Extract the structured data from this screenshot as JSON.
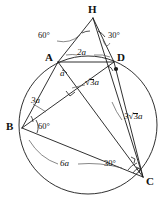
{
  "figure": {
    "type": "euclidean-geometry-diagram",
    "stroke_color": "#1a1a1a",
    "background": "#ffffff",
    "circle": {
      "cx": 88,
      "cy": 125,
      "r": 69
    },
    "points": [
      {
        "id": "H",
        "label": "H",
        "x": 93,
        "y": 18,
        "on_circle": false,
        "marker": "none"
      },
      {
        "id": "A",
        "label": "A",
        "x": 58,
        "y": 62,
        "on_circle": true,
        "marker": "none"
      },
      {
        "id": "D",
        "label": "D",
        "x": 114,
        "y": 62,
        "on_circle": true,
        "marker": "dot"
      },
      {
        "id": "B",
        "label": "B",
        "x": 22,
        "y": 128,
        "on_circle": true,
        "marker": "none"
      },
      {
        "id": "C",
        "label": "C",
        "x": 143,
        "y": 177,
        "on_circle": true,
        "marker": "none"
      },
      {
        "id": "P",
        "label": "",
        "x": 72,
        "y": 88,
        "on_circle": false,
        "marker": "none"
      }
    ],
    "segments": [
      {
        "from": "H",
        "to": "A"
      },
      {
        "from": "H",
        "to": "D"
      },
      {
        "from": "H",
        "to": "C"
      },
      {
        "from": "A",
        "to": "D"
      },
      {
        "from": "A",
        "to": "B"
      },
      {
        "from": "A",
        "to": "C"
      },
      {
        "from": "B",
        "to": "D"
      },
      {
        "from": "B",
        "to": "C"
      },
      {
        "from": "D",
        "to": "C"
      }
    ],
    "right_angle_marks": [
      {
        "at": "P",
        "x": 72,
        "y": 88
      },
      {
        "at": "C1",
        "x": 133,
        "y": 160
      },
      {
        "at": "C2",
        "x": 139,
        "y": 170
      }
    ],
    "angle_labels": [
      {
        "id": "angle-H-left",
        "text": "60°",
        "x": 38,
        "y": 35
      },
      {
        "id": "angle-H-right",
        "text": "30°",
        "x": 108,
        "y": 35
      },
      {
        "id": "angle-B",
        "text": "60°",
        "x": 33,
        "y": 122
      },
      {
        "id": "angle-C",
        "text": "30°",
        "x": 104,
        "y": 159
      }
    ],
    "segment_labels": [
      {
        "id": "len-AD",
        "text": "2a",
        "x": 79,
        "y": 51,
        "kind": "plain"
      },
      {
        "id": "len-AP",
        "text": "a",
        "x": 61,
        "y": 71,
        "kind": "plain"
      },
      {
        "id": "len-PD",
        "text": "√3 a",
        "x": 86,
        "y": 82,
        "kind": "radical",
        "coefficient": "",
        "radicand": "3",
        "suffix": "a"
      },
      {
        "id": "len-AB",
        "text": "3a",
        "x": 34,
        "y": 98,
        "kind": "plain"
      },
      {
        "id": "len-DC",
        "text": "3√3 a",
        "x": 126,
        "y": 116,
        "kind": "radical",
        "coefficient": "3",
        "radicand": "3",
        "suffix": "a"
      },
      {
        "id": "len-BC",
        "text": "6a",
        "x": 61,
        "y": 161,
        "kind": "plain"
      }
    ],
    "leader_arcs": [
      {
        "id": "leader-60-H",
        "from_label": "angle-H-left"
      },
      {
        "id": "leader-30-H",
        "from_label": "angle-H-right"
      },
      {
        "id": "leader-2a",
        "from_label": "len-AD"
      },
      {
        "id": "leader-sqrt3",
        "from_label": "len-PD"
      },
      {
        "id": "leader-3a",
        "from_label": "len-AB"
      },
      {
        "id": "leader-3sqrt3",
        "from_label": "len-DC"
      },
      {
        "id": "leader-6a",
        "from_label": "len-BC"
      }
    ]
  }
}
